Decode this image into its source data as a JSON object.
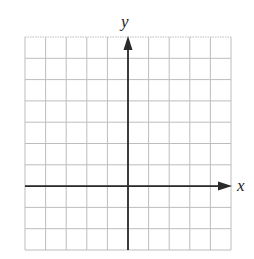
{
  "chart_data": {
    "type": "coordinate-grid",
    "title": "",
    "xlabel": "x",
    "ylabel": "y",
    "grid": true,
    "grid_columns": 10,
    "grid_rows": 10,
    "y_axis_column_index": 5,
    "x_axis_row_index_from_top": 7,
    "x_range_units": [
      -5,
      5
    ],
    "y_range_units": [
      -3,
      7
    ],
    "tick_labels": [],
    "series": []
  },
  "colors": {
    "grid": "#bdbdbd",
    "axes": "#2a2a2a",
    "background": "#ffffff"
  },
  "labels": {
    "x_axis": "x",
    "y_axis": "y"
  }
}
